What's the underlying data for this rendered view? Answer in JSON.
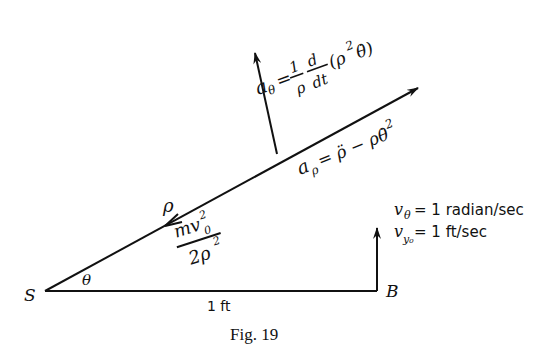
{
  "figure": {
    "caption": "Fig. 19",
    "points": {
      "origin": "S",
      "end": "B"
    },
    "base_length_label": "1 ft",
    "angle_label": "θ",
    "radius_label": "ρ",
    "force_label": {
      "numerator": "mv",
      "numerator_sub": "0",
      "numerator_sup": "2",
      "denominator": "2ρ",
      "denominator_sup": "2"
    },
    "radial_acceleration": {
      "lhs": "a",
      "lhs_sub": "ρ",
      "rhs": "= ρ̈ − ρθ̇",
      "rhs_sup": "2"
    },
    "transverse_acceleration": {
      "lhs": "a",
      "lhs_sub": "θ",
      "eq": "=",
      "frac1_num": "1",
      "frac1_den": "ρ",
      "frac2_num": "d",
      "frac2_den": "dt",
      "paren_open": "(ρ",
      "paren_sup": "2",
      "paren_close": "θ̇)"
    },
    "conditions": [
      {
        "var": "v",
        "sub": "θ",
        "value": "= 1 radian/sec"
      },
      {
        "var": "v",
        "sub": "y₀",
        "value": "= 1 ft/sec"
      }
    ]
  }
}
